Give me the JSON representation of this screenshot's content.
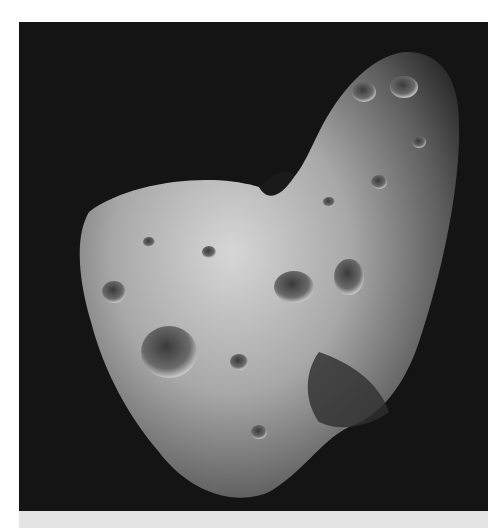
{
  "image": {
    "subject": "asteroid",
    "alt": "Grayscale photograph of an elongated, cratered asteroid against a black background",
    "colors": {
      "background": "#141414",
      "surface_light": "#d8d8d8",
      "surface_mid": "#8a8a8a",
      "surface_dark": "#3a3a3a",
      "band": "#e4e4e4"
    }
  }
}
